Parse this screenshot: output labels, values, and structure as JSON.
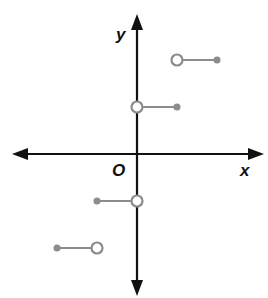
{
  "chart_data": {
    "type": "line",
    "title": "",
    "xlabel": "x",
    "ylabel": "y",
    "origin_label": "O",
    "grid": false,
    "xlim": [
      -3,
      3
    ],
    "ylim": [
      -3,
      3
    ],
    "segments": [
      {
        "x_start": 0,
        "x_end": 1,
        "y": 1,
        "start_closed": false,
        "end_closed": true
      },
      {
        "x_start": 1,
        "x_end": 2,
        "y": 2,
        "start_closed": false,
        "end_closed": true
      },
      {
        "x_start": -1,
        "x_end": 0,
        "y": -1,
        "start_closed": true,
        "end_closed": false
      },
      {
        "x_start": -2,
        "x_end": -1,
        "y": -2,
        "start_closed": true,
        "end_closed": false
      }
    ],
    "colors": {
      "axis": "#111111",
      "segment": "#8c8c8c"
    }
  },
  "labels": {
    "x_axis": "x",
    "y_axis": "y",
    "origin": "O"
  }
}
